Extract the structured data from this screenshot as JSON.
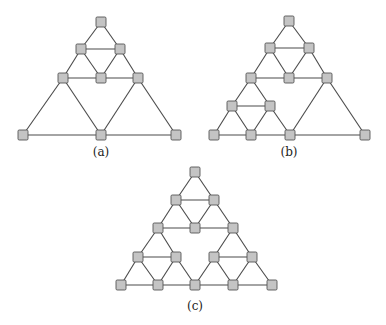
{
  "figure": {
    "style": {
      "node_fill": "#c4c4c4",
      "node_stroke": "#555555",
      "edge_color": "#4a4a4a",
      "node_size": 10
    },
    "panels": [
      {
        "id": "a",
        "label": "(a)",
        "label_pos": [
          101,
          156
        ],
        "nodes": [
          [
            101,
            22
          ],
          [
            81,
            49
          ],
          [
            120,
            49
          ],
          [
            63,
            78
          ],
          [
            101,
            78
          ],
          [
            138,
            78
          ],
          [
            23,
            135
          ],
          [
            101,
            135
          ],
          [
            176,
            135
          ]
        ],
        "edges": [
          [
            0,
            1
          ],
          [
            0,
            2
          ],
          [
            1,
            2
          ],
          [
            1,
            3
          ],
          [
            1,
            4
          ],
          [
            2,
            4
          ],
          [
            2,
            5
          ],
          [
            3,
            4
          ],
          [
            4,
            5
          ],
          [
            3,
            6
          ],
          [
            3,
            7
          ],
          [
            5,
            7
          ],
          [
            5,
            8
          ],
          [
            6,
            7
          ],
          [
            7,
            8
          ]
        ]
      },
      {
        "id": "b",
        "label": "(b)",
        "label_pos": [
          289,
          156
        ],
        "nodes": [
          [
            289,
            21
          ],
          [
            270,
            48
          ],
          [
            309,
            48
          ],
          [
            251,
            78
          ],
          [
            289,
            78
          ],
          [
            327,
            78
          ],
          [
            232,
            106
          ],
          [
            270,
            106
          ],
          [
            214,
            135
          ],
          [
            251,
            135
          ],
          [
            290,
            135
          ],
          [
            365,
            135
          ]
        ],
        "edges": [
          [
            0,
            1
          ],
          [
            0,
            2
          ],
          [
            1,
            2
          ],
          [
            1,
            3
          ],
          [
            1,
            4
          ],
          [
            2,
            4
          ],
          [
            2,
            5
          ],
          [
            3,
            4
          ],
          [
            4,
            5
          ],
          [
            3,
            6
          ],
          [
            3,
            7
          ],
          [
            6,
            7
          ],
          [
            6,
            8
          ],
          [
            6,
            9
          ],
          [
            7,
            9
          ],
          [
            7,
            10
          ],
          [
            8,
            9
          ],
          [
            9,
            10
          ],
          [
            5,
            10
          ],
          [
            5,
            11
          ],
          [
            10,
            11
          ]
        ]
      },
      {
        "id": "c",
        "label": "(c)",
        "label_pos": [
          195,
          310
        ],
        "nodes": [
          [
            195,
            172
          ],
          [
            176,
            200
          ],
          [
            214,
            200
          ],
          [
            158,
            228
          ],
          [
            195,
            228
          ],
          [
            233,
            228
          ],
          [
            138,
            257
          ],
          [
            176,
            257
          ],
          [
            214,
            257
          ],
          [
            252,
            257
          ],
          [
            121,
            285
          ],
          [
            158,
            285
          ],
          [
            195,
            285
          ],
          [
            233,
            285
          ],
          [
            272,
            285
          ]
        ],
        "edges": [
          [
            0,
            1
          ],
          [
            0,
            2
          ],
          [
            1,
            2
          ],
          [
            1,
            3
          ],
          [
            1,
            4
          ],
          [
            2,
            4
          ],
          [
            2,
            5
          ],
          [
            3,
            4
          ],
          [
            4,
            5
          ],
          [
            3,
            6
          ],
          [
            3,
            7
          ],
          [
            6,
            7
          ],
          [
            6,
            10
          ],
          [
            6,
            11
          ],
          [
            7,
            11
          ],
          [
            7,
            12
          ],
          [
            5,
            8
          ],
          [
            5,
            9
          ],
          [
            8,
            9
          ],
          [
            8,
            12
          ],
          [
            8,
            13
          ],
          [
            9,
            13
          ],
          [
            9,
            14
          ],
          [
            10,
            11
          ],
          [
            11,
            12
          ],
          [
            12,
            13
          ],
          [
            13,
            14
          ]
        ]
      }
    ]
  }
}
